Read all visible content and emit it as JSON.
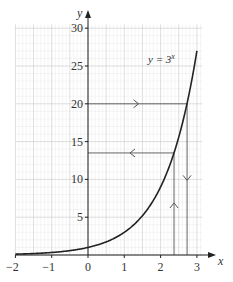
{
  "chart_data": {
    "type": "line",
    "title": "",
    "xlabel": "x",
    "ylabel": "y",
    "xlim": [
      -2,
      3.15
    ],
    "ylim": [
      0,
      30.5
    ],
    "grid": true,
    "x_ticks": [
      -2,
      -1,
      0,
      1,
      2,
      3
    ],
    "x_tick_labels": [
      "−2",
      "−1",
      "0",
      "1",
      "2",
      "3"
    ],
    "y_ticks": [
      5,
      10,
      15,
      20,
      25,
      30
    ],
    "y_tick_labels": [
      "5",
      "10",
      "15",
      "20",
      "25",
      "30"
    ],
    "series": [
      {
        "name": "y = 3^x",
        "label_text": "y = 3",
        "label_sup": "x",
        "x": [
          -2,
          -1.5,
          -1,
          -0.5,
          0,
          0.5,
          1,
          1.5,
          2,
          2.5,
          3
        ],
        "y": [
          0.111,
          0.192,
          0.333,
          0.577,
          1,
          1.732,
          3,
          5.196,
          9,
          15.588,
          27
        ]
      }
    ],
    "annotations": [
      {
        "type": "horizontal-arrow-line",
        "y": 20,
        "x_from": 0,
        "x_to": 2.73,
        "direction": "right"
      },
      {
        "type": "vertical-arrow-line",
        "x": 2.73,
        "y_from": 20,
        "y_to": 0,
        "direction": "down"
      },
      {
        "type": "vertical-arrow-line",
        "x": 2.37,
        "y_from": 0,
        "y_to": 13.5,
        "direction": "up"
      },
      {
        "type": "horizontal-arrow-line",
        "y": 13.5,
        "x_from": 2.37,
        "x_to": 0,
        "direction": "left"
      }
    ]
  }
}
